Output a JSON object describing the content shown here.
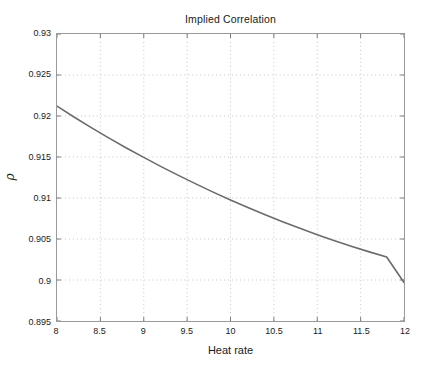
{
  "chart_data": {
    "type": "line",
    "title": "Implied Correlation",
    "xlabel": "Heat rate",
    "ylabel": "ρ",
    "xlim": [
      8,
      12
    ],
    "ylim": [
      0.895,
      0.93
    ],
    "grid": true,
    "grid_style": "dotted",
    "legend": null,
    "background": "#ffffff",
    "axis_color": "#9a9a9a",
    "grid_color": "#b8b8b8",
    "xticks": [
      8,
      8.5,
      9,
      9.5,
      10,
      10.5,
      11,
      11.5,
      12
    ],
    "xticklabels": [
      "8",
      "8.5",
      "9",
      "9.5",
      "10",
      "10.5",
      "11",
      "11.5",
      "12"
    ],
    "yticks": [
      0.895,
      0.9,
      0.905,
      0.91,
      0.915,
      0.92,
      0.925,
      0.93
    ],
    "yticklabels": [
      "0.895",
      "0.9",
      "0.905",
      "0.91",
      "0.915",
      "0.92",
      "0.925",
      "0.93"
    ],
    "series": [
      {
        "name": "implied correlation",
        "color": "#6b6b6b",
        "linewidth": 1.6,
        "x": [
          8.0,
          8.2,
          8.4,
          8.6,
          8.8,
          9.0,
          9.2,
          9.4,
          9.6,
          9.8,
          10.0,
          10.2,
          10.4,
          10.6,
          10.8,
          11.0,
          11.2,
          11.4,
          11.6,
          11.8,
          12.0
        ],
        "values": [
          0.9212,
          0.91985,
          0.91855,
          0.9173,
          0.9161,
          0.91495,
          0.91383,
          0.91276,
          0.91172,
          0.91072,
          0.90976,
          0.90884,
          0.90796,
          0.90711,
          0.9063,
          0.90553,
          0.90479,
          0.90409,
          0.90343,
          0.9028,
          0.8997
        ]
      }
    ]
  }
}
